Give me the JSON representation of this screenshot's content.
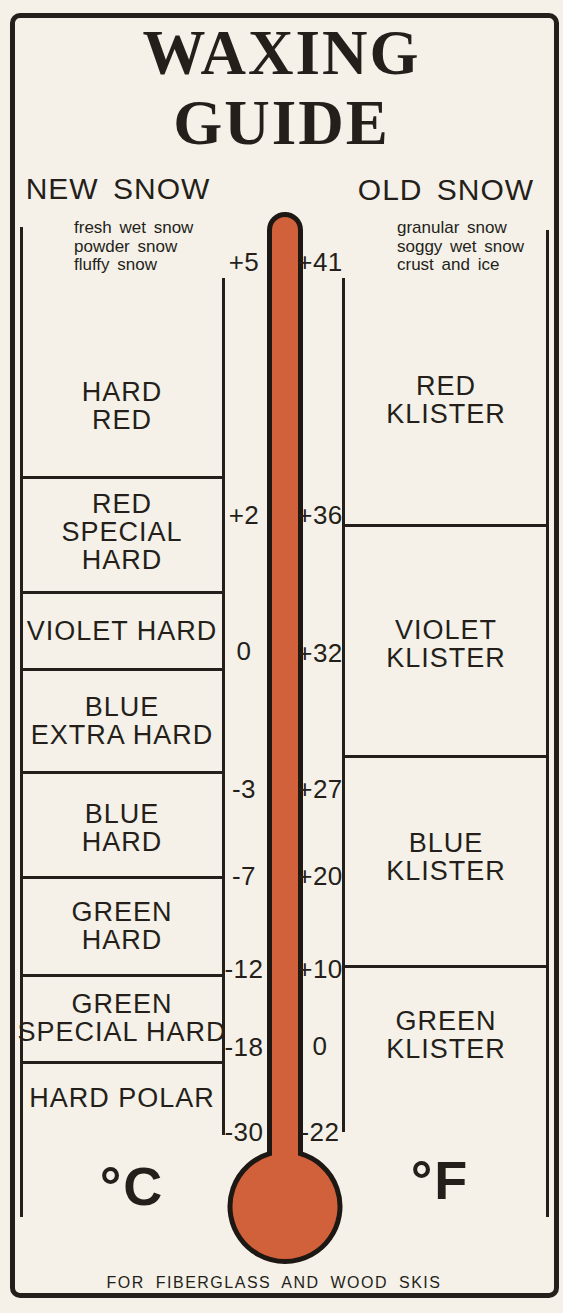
{
  "title_lines": [
    "WAXING",
    "GUIDE"
  ],
  "footer": "FOR FIBERGLASS AND WOOD SKIS",
  "thermometer_color": "#d0613a",
  "ink_color": "#241f1a",
  "paper_color": "#f5f1e8",
  "new_snow": {
    "header": "NEW SNOW",
    "description_lines": [
      "fresh wet snow",
      "powder snow",
      "fluffy snow"
    ],
    "unit": "°C",
    "scale": [
      "+5",
      "+2",
      "0",
      "-3",
      "-7",
      "-12",
      "-18",
      "-30"
    ],
    "waxes": [
      {
        "name": "hard-red",
        "lines": [
          "HARD",
          "RED"
        ]
      },
      {
        "name": "red-special-hard",
        "lines": [
          "RED",
          "SPECIAL",
          "HARD"
        ]
      },
      {
        "name": "violet-hard",
        "lines": [
          "VIOLET HARD"
        ]
      },
      {
        "name": "blue-extra-hard",
        "lines": [
          "BLUE",
          "EXTRA HARD"
        ]
      },
      {
        "name": "blue-hard",
        "lines": [
          "BLUE",
          "HARD"
        ]
      },
      {
        "name": "green-hard",
        "lines": [
          "GREEN",
          "HARD"
        ]
      },
      {
        "name": "green-special-hard",
        "lines": [
          "GREEN",
          "SPECIAL HARD"
        ]
      },
      {
        "name": "hard-polar",
        "lines": [
          "HARD POLAR"
        ]
      }
    ]
  },
  "old_snow": {
    "header": "OLD SNOW",
    "description_lines": [
      "granular snow",
      "soggy wet snow",
      "crust and ice"
    ],
    "unit": "°F",
    "scale": [
      "+41",
      "+36",
      "+32",
      "+27",
      "+20",
      "+10",
      "0",
      "-22"
    ],
    "waxes": [
      {
        "name": "red-klister",
        "lines": [
          "RED",
          "KLISTER"
        ]
      },
      {
        "name": "violet-klister",
        "lines": [
          "VIOLET",
          "KLISTER"
        ]
      },
      {
        "name": "blue-klister",
        "lines": [
          "BLUE",
          "KLISTER"
        ]
      },
      {
        "name": "green-klister",
        "lines": [
          "GREEN",
          "KLISTER"
        ]
      }
    ]
  }
}
